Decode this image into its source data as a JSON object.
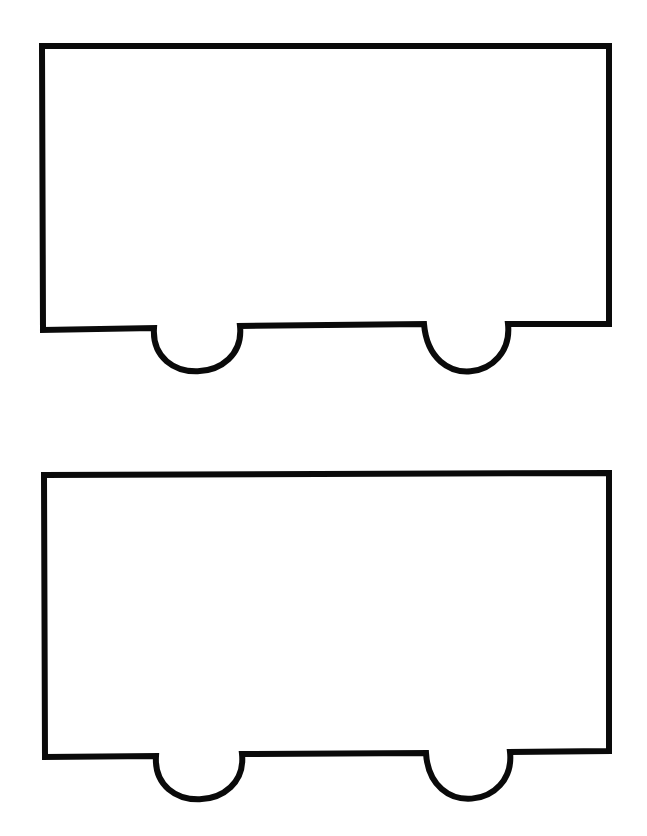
{
  "page": {
    "background": "#ffffff",
    "stroke_color": "#0a0a0a",
    "stroke_width": 6
  },
  "shapes": [
    {
      "name": "train-car-outline-top",
      "path": "M 42 46 L 609 46 L 609 324 L 508 324 C 514 380 430 394 424 324 L 240 326 C 246 384 150 388 154 328 L 43 330 Z"
    },
    {
      "name": "train-car-outline-bottom",
      "path": "M 44 475 L 609 473 L 609 751 L 510 752 C 516 808 430 820 426 753 L 242 754 C 248 812 152 816 156 756 L 45 757 Z"
    }
  ]
}
